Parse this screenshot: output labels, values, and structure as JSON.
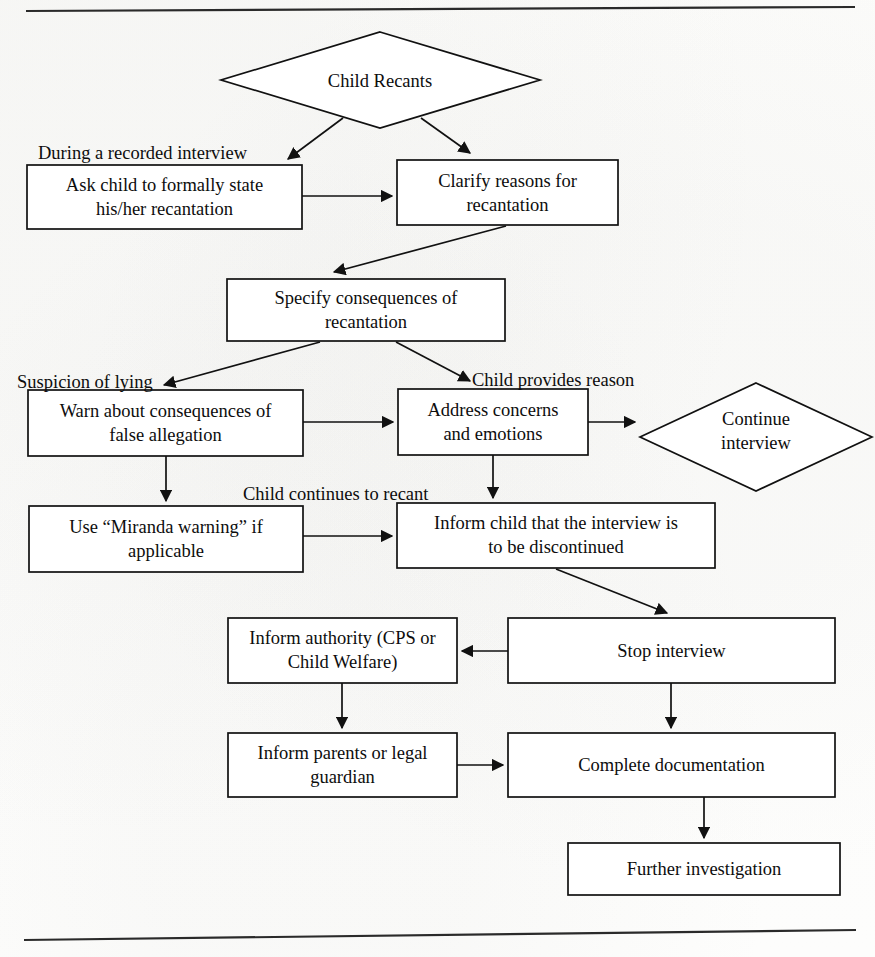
{
  "figure": {
    "type": "flowchart",
    "orientation": "top-to-bottom",
    "colors": {
      "stroke": "#111111",
      "node_fill": "#ffffff",
      "text": "#0d0d0d",
      "background": "#fdfdfc",
      "rule": "#2a2a2a"
    }
  },
  "nodes": {
    "child_recants": {
      "shape": "diamond",
      "label": "Child Recants"
    },
    "ask_child_state": {
      "shape": "rect",
      "line1": "Ask child to formally state",
      "line2": "his/her recantation"
    },
    "clarify_reasons": {
      "shape": "rect",
      "line1": "Clarify reasons for",
      "line2": "recantation"
    },
    "specify_consequences": {
      "shape": "rect",
      "line1": "Specify consequences of",
      "line2": "recantation"
    },
    "warn_false_allegation": {
      "shape": "rect",
      "line1": "Warn about consequences of",
      "line2": "false allegation"
    },
    "address_concerns": {
      "shape": "rect",
      "line1": "Address concerns",
      "line2": "and emotions"
    },
    "continue_interview": {
      "shape": "diamond",
      "line1": "Continue",
      "line2": "interview"
    },
    "miranda_warning": {
      "shape": "rect",
      "line1": "Use “Miranda warning” if",
      "line2": "applicable"
    },
    "inform_discontinued": {
      "shape": "rect",
      "line1": "Inform child that the interview is",
      "line2": "to be discontinued"
    },
    "inform_authority": {
      "shape": "rect",
      "line1": "Inform authority (CPS or",
      "line2": "Child Welfare)"
    },
    "stop_interview": {
      "shape": "rect",
      "line1": "Stop interview",
      "line2": ""
    },
    "inform_parents": {
      "shape": "rect",
      "line1": "Inform parents or legal",
      "line2": "guardian"
    },
    "complete_documentation": {
      "shape": "rect",
      "line1": "Complete documentation",
      "line2": ""
    },
    "further_investigation": {
      "shape": "rect",
      "line1": "Further investigation",
      "line2": ""
    }
  },
  "edge_labels": {
    "during_recorded_interview": "During a recorded interview",
    "suspicion_of_lying": "Suspicion of lying",
    "child_provides_reason": "Child provides reason",
    "child_continues_to_recant": "Child continues to recant"
  },
  "edges": [
    {
      "from": "child_recants",
      "to": "ask_child_state",
      "label": "During a recorded interview"
    },
    {
      "from": "child_recants",
      "to": "clarify_reasons",
      "label": ""
    },
    {
      "from": "ask_child_state",
      "to": "clarify_reasons",
      "label": ""
    },
    {
      "from": "clarify_reasons",
      "to": "specify_consequences",
      "label": ""
    },
    {
      "from": "specify_consequences",
      "to": "warn_false_allegation",
      "label": "Suspicion of lying"
    },
    {
      "from": "specify_consequences",
      "to": "address_concerns",
      "label": "Child provides reason"
    },
    {
      "from": "warn_false_allegation",
      "to": "address_concerns",
      "label": ""
    },
    {
      "from": "address_concerns",
      "to": "continue_interview",
      "label": ""
    },
    {
      "from": "warn_false_allegation",
      "to": "miranda_warning",
      "label": ""
    },
    {
      "from": "address_concerns",
      "to": "inform_discontinued",
      "label": "Child continues to recant"
    },
    {
      "from": "miranda_warning",
      "to": "inform_discontinued",
      "label": ""
    },
    {
      "from": "inform_discontinued",
      "to": "stop_interview",
      "label": ""
    },
    {
      "from": "stop_interview",
      "to": "inform_authority",
      "label": ""
    },
    {
      "from": "inform_authority",
      "to": "inform_parents",
      "label": ""
    },
    {
      "from": "stop_interview",
      "to": "complete_documentation",
      "label": ""
    },
    {
      "from": "inform_parents",
      "to": "complete_documentation",
      "label": ""
    },
    {
      "from": "complete_documentation",
      "to": "further_investigation",
      "label": ""
    }
  ]
}
